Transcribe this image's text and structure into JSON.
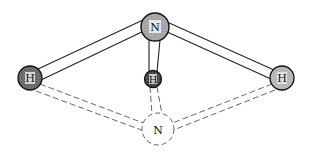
{
  "diagram": {
    "type": "molecular-structure",
    "atoms": [
      {
        "id": "n-top",
        "label": "N",
        "cx": 155,
        "cy": 27,
        "r": 14,
        "fill": "#9a9a9a",
        "style": "solid"
      },
      {
        "id": "h-left",
        "label": "H",
        "cx": 30,
        "cy": 78,
        "r": 12,
        "fill": "#6e6e6e",
        "style": "solid"
      },
      {
        "id": "h-middle",
        "label": "H",
        "cx": 153,
        "cy": 79,
        "r": 8,
        "fill": "#4a4a4a",
        "style": "solid"
      },
      {
        "id": "h-right",
        "label": "H",
        "cx": 282,
        "cy": 78,
        "r": 12,
        "fill": "#a8a8a8",
        "style": "solid"
      },
      {
        "id": "n-bottom",
        "label": "N",
        "cx": 158,
        "cy": 129,
        "r": 16,
        "fill": "#ffffff",
        "style": "dashed"
      }
    ],
    "bonds": [
      {
        "from": "n-top",
        "to": "h-left",
        "style": "solid"
      },
      {
        "from": "n-top",
        "to": "h-middle",
        "style": "solid"
      },
      {
        "from": "n-top",
        "to": "h-right",
        "style": "solid"
      },
      {
        "from": "n-bottom",
        "to": "h-left",
        "style": "dashed"
      },
      {
        "from": "n-bottom",
        "to": "h-middle",
        "style": "dashed"
      },
      {
        "from": "n-bottom",
        "to": "h-right",
        "style": "dashed"
      }
    ],
    "labels": {
      "n_top": "N",
      "h_left": "H",
      "h_middle": "H",
      "h_right": "H",
      "n_bottom": "N"
    },
    "colors": {
      "background": "#ffffff",
      "stroke": "#222222",
      "n_top_fill": "#9a9a9a",
      "h_left_fill": "#6e6e6e",
      "h_middle_fill": "#4a4a4a",
      "h_right_fill": "#a8a8a8"
    }
  }
}
